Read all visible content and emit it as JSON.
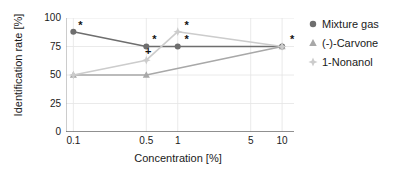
{
  "chart_data": {
    "type": "line",
    "title": "",
    "xlabel": "Concentration [%]",
    "ylabel": "Identification rate [%]",
    "xscale": "log",
    "xlim": [
      0.085,
      13.0
    ],
    "ylim": [
      0,
      100
    ],
    "yticks": [
      "0",
      "25",
      "50",
      "75",
      "100"
    ],
    "ytick_values": [
      0,
      25,
      50,
      75,
      100
    ],
    "xticks": [
      "0.1",
      "0.5",
      "1",
      "5",
      "10"
    ],
    "xtick_values": [
      0.1,
      0.5,
      1,
      5,
      10
    ],
    "grid": "both",
    "legend_position": "right",
    "series": [
      {
        "name": "Mixture gas",
        "marker": "circle",
        "color": "#6e6e6e",
        "x": [
          0.1,
          0.5,
          1,
          10
        ],
        "values": [
          88,
          75,
          75,
          75
        ]
      },
      {
        "name": "(-)-Carvone",
        "marker": "triangle",
        "color": "#a8a8a8",
        "x": [
          0.1,
          0.5,
          10
        ],
        "values": [
          50,
          50,
          75
        ]
      },
      {
        "name": "1-Nonanol",
        "marker": "star",
        "color": "#cccccc",
        "x": [
          0.1,
          0.5,
          1,
          10
        ],
        "values": [
          50,
          63,
          88,
          75
        ]
      }
    ],
    "annotations": [
      {
        "label": "*",
        "x": 0.1,
        "y": 88,
        "dx": 7,
        "dy": -7
      },
      {
        "label": "*",
        "x": 0.5,
        "y": 75,
        "dx": 8,
        "dy": -8
      },
      {
        "label": "+",
        "x": 0.5,
        "y": 63,
        "dx": 2,
        "dy": -9
      },
      {
        "label": "*",
        "x": 1.0,
        "y": 88,
        "dx": 9,
        "dy": -7
      },
      {
        "label": "*",
        "x": 1.0,
        "y": 75,
        "dx": 9,
        "dy": -8
      },
      {
        "label": "*",
        "x": 10.0,
        "y": 75,
        "dx": 10,
        "dy": -8
      }
    ]
  },
  "legend": {
    "items": [
      {
        "label": "Mixture gas"
      },
      {
        "label": "(-)-Carvone"
      },
      {
        "label": "1-Nonanol"
      }
    ]
  }
}
